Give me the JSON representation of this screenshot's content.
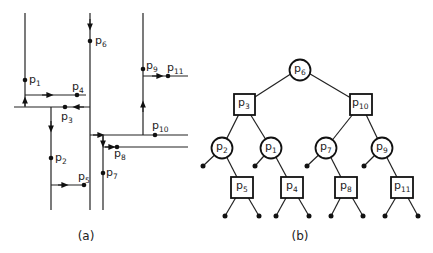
{
  "figure": {
    "panel_a": {
      "caption": "(a)",
      "points": [
        {
          "id": "p1",
          "base": "p",
          "sub": "1"
        },
        {
          "id": "p2",
          "base": "p",
          "sub": "2"
        },
        {
          "id": "p3",
          "base": "p",
          "sub": "3"
        },
        {
          "id": "p4",
          "base": "p",
          "sub": "4"
        },
        {
          "id": "p5",
          "base": "p",
          "sub": "5"
        },
        {
          "id": "p6",
          "base": "p",
          "sub": "6"
        },
        {
          "id": "p7",
          "base": "p",
          "sub": "7"
        },
        {
          "id": "p8",
          "base": "p",
          "sub": "8"
        },
        {
          "id": "p9",
          "base": "p",
          "sub": "9"
        },
        {
          "id": "p10",
          "base": "p",
          "sub": "10"
        },
        {
          "id": "p11",
          "base": "p",
          "sub": "11"
        }
      ]
    },
    "panel_b": {
      "caption": "(b)",
      "nodes": [
        {
          "id": "p6",
          "base": "p",
          "sub": "6",
          "shape": "circle",
          "level": 0
        },
        {
          "id": "p3",
          "base": "p",
          "sub": "3",
          "shape": "square",
          "level": 1
        },
        {
          "id": "p10",
          "base": "p",
          "sub": "10",
          "shape": "square",
          "level": 1
        },
        {
          "id": "p2",
          "base": "p",
          "sub": "2",
          "shape": "circle",
          "level": 2
        },
        {
          "id": "p1",
          "base": "p",
          "sub": "1",
          "shape": "circle",
          "level": 2
        },
        {
          "id": "p7",
          "base": "p",
          "sub": "7",
          "shape": "circle",
          "level": 2
        },
        {
          "id": "p9",
          "base": "p",
          "sub": "9",
          "shape": "circle",
          "level": 2
        },
        {
          "id": "p5",
          "base": "p",
          "sub": "5",
          "shape": "square",
          "level": 3
        },
        {
          "id": "p4",
          "base": "p",
          "sub": "4",
          "shape": "square",
          "level": 3
        },
        {
          "id": "p8",
          "base": "p",
          "sub": "8",
          "shape": "square",
          "level": 3
        },
        {
          "id": "p11",
          "base": "p",
          "sub": "11",
          "shape": "square",
          "level": 3
        }
      ],
      "edges": [
        [
          "p6",
          "p3"
        ],
        [
          "p6",
          "p10"
        ],
        [
          "p3",
          "p2"
        ],
        [
          "p3",
          "p1"
        ],
        [
          "p10",
          "p7"
        ],
        [
          "p10",
          "p9"
        ],
        [
          "p2",
          "p5"
        ],
        [
          "p1",
          "p4"
        ],
        [
          "p7",
          "p8"
        ],
        [
          "p9",
          "p11"
        ]
      ]
    }
  }
}
